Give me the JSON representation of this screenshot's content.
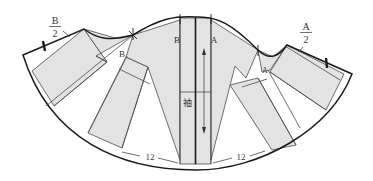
{
  "diagram": {
    "type": "sewing-pattern",
    "labels": {
      "b_half_numerator": "B",
      "b_half_denominator": "2",
      "a_half_numerator": "A",
      "a_half_denominator": "2",
      "b_left_inner": "B",
      "b_center": "B",
      "a_center": "A",
      "a_right_inner": "A",
      "sleeve": "袖",
      "measure_left": "12",
      "measure_right": "12"
    },
    "colors": {
      "piece_fill": "#e3e3e3",
      "outline": "#1a1a1a",
      "background": "#ffffff"
    }
  }
}
